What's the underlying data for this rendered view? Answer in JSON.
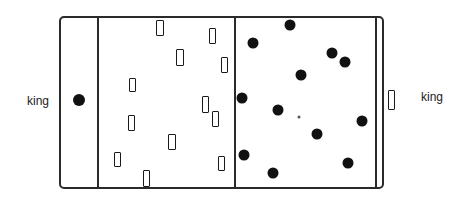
{
  "labels": {
    "left_king": "king",
    "right_king": "king"
  },
  "colors": {
    "line": "#2a2a2a",
    "dot": "#111111",
    "background": "#ffffff"
  },
  "board": {
    "outer": {
      "x": 59,
      "y": 16,
      "w": 325,
      "h": 173
    },
    "dividers_x": [
      98,
      235,
      376
    ]
  },
  "left_king_piece": {
    "type": "dot",
    "x": 79,
    "y": 100
  },
  "right_king_piece": {
    "type": "rectangle",
    "x": 388,
    "y": 90,
    "w": 7,
    "h": 20
  },
  "rectangle_pieces": [
    {
      "x": 156,
      "y": 20,
      "w": 8,
      "h": 16
    },
    {
      "x": 209,
      "y": 28,
      "w": 7,
      "h": 16
    },
    {
      "x": 176,
      "y": 49,
      "w": 8,
      "h": 17
    },
    {
      "x": 221,
      "y": 57,
      "w": 7,
      "h": 16
    },
    {
      "x": 129,
      "y": 78,
      "w": 7,
      "h": 14
    },
    {
      "x": 202,
      "y": 96,
      "w": 7,
      "h": 17
    },
    {
      "x": 212,
      "y": 111,
      "w": 7,
      "h": 16
    },
    {
      "x": 128,
      "y": 115,
      "w": 7,
      "h": 16
    },
    {
      "x": 168,
      "y": 134,
      "w": 8,
      "h": 16
    },
    {
      "x": 114,
      "y": 152,
      "w": 7,
      "h": 15
    },
    {
      "x": 218,
      "y": 156,
      "w": 7,
      "h": 15
    },
    {
      "x": 143,
      "y": 170,
      "w": 7,
      "h": 17
    }
  ],
  "dot_pieces": [
    {
      "x": 290,
      "y": 25
    },
    {
      "x": 253,
      "y": 43
    },
    {
      "x": 332,
      "y": 53
    },
    {
      "x": 345,
      "y": 62
    },
    {
      "x": 301,
      "y": 75
    },
    {
      "x": 242,
      "y": 98
    },
    {
      "x": 278,
      "y": 110
    },
    {
      "x": 362,
      "y": 121
    },
    {
      "x": 317,
      "y": 134
    },
    {
      "x": 244,
      "y": 155
    },
    {
      "x": 348,
      "y": 163
    },
    {
      "x": 273,
      "y": 173
    }
  ],
  "center_mark": {
    "x": 299,
    "y": 117
  }
}
